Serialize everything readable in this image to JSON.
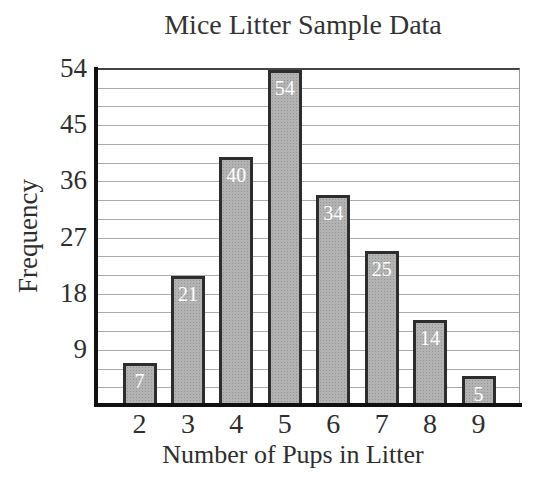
{
  "chart_data": {
    "type": "bar",
    "title": "Mice Litter Sample Data",
    "xlabel": "Number of Pups in Litter",
    "ylabel": "Frequency",
    "categories": [
      "2",
      "3",
      "4",
      "5",
      "6",
      "7",
      "8",
      "9"
    ],
    "values": [
      7,
      21,
      40,
      54,
      34,
      25,
      14,
      5
    ],
    "bar_value_labels": [
      "7",
      "21",
      "40",
      "54",
      "34",
      "25",
      "14",
      "5"
    ],
    "yticks": [
      9,
      18,
      27,
      36,
      45,
      54
    ],
    "ylim": [
      0,
      54
    ],
    "gridline_step": 3,
    "grid": true,
    "legend": "none",
    "colors": {
      "background": "#ffffff",
      "bar_fill": "#b3b3b3",
      "bar_border": "#2d2d2d",
      "bar_label_text": "#ffffff",
      "gridline": "#ababab",
      "axis_line": "#101010",
      "text": "#2e2e2e"
    }
  }
}
